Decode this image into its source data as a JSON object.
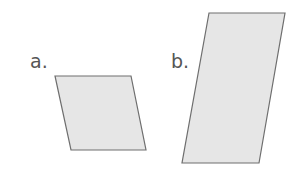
{
  "figure": {
    "background": "#ffffff",
    "shape_fill": "#e6e6e6",
    "shape_stroke": "#6e6e6e",
    "shapes": [
      {
        "label": "a.",
        "type": "parallelogram",
        "points": "55,76 131,76 146,150 71,150"
      },
      {
        "label": "b.",
        "type": "parallelogram",
        "points": "209,13 285,13 259,163 182,163"
      }
    ]
  }
}
